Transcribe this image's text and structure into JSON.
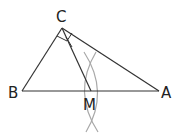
{
  "diagram": {
    "type": "geometry",
    "points": {
      "C": {
        "label": "C",
        "x": 62,
        "y": 28
      },
      "B": {
        "label": "B",
        "x": 22,
        "y": 91
      },
      "A": {
        "label": "A",
        "x": 159,
        "y": 91
      },
      "M": {
        "label": "M",
        "x": 91,
        "y": 91
      }
    },
    "segments": [
      "CB",
      "CA",
      "BA",
      "CM"
    ],
    "right_angle_marks": [
      "C"
    ],
    "construction_arcs": {
      "color": "#a8a8a8",
      "count": 2
    },
    "colors": {
      "line": "#333333",
      "arc": "#a8a8a8",
      "label": "#222222"
    }
  }
}
